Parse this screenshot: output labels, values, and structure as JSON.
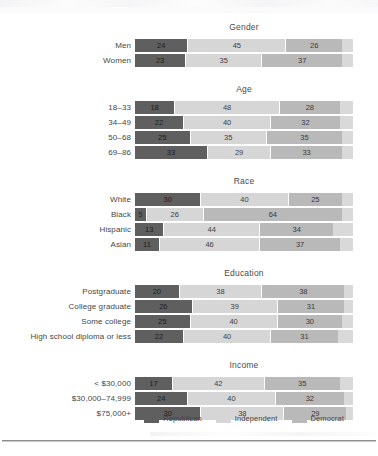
{
  "chart_data": {
    "type": "bar",
    "subtype": "stacked-horizontal-100",
    "title": "",
    "xlabel": "",
    "ylabel": "",
    "xlim": [
      0,
      100
    ],
    "grid": false,
    "legend_position": "bottom-center",
    "legend": [
      "Republican",
      "Independent",
      "Democrat"
    ],
    "series": [
      {
        "name": "Republican",
        "color": "#5f5f5f"
      },
      {
        "name": "Independent",
        "color": "#d6d6d6"
      },
      {
        "name": "Democrat",
        "color": "#b9b9b9"
      }
    ],
    "groups": [
      {
        "title": "Gender",
        "categories": [
          "Men",
          "Women"
        ],
        "rows": [
          {
            "label": "Men",
            "republican": 24,
            "independent": 45,
            "democrat": 26
          },
          {
            "label": "Women",
            "republican": 23,
            "independent": 35,
            "democrat": 37
          }
        ]
      },
      {
        "title": "Age",
        "categories": [
          "18–33",
          "34–49",
          "50–68",
          "69–86"
        ],
        "rows": [
          {
            "label": "18–33",
            "republican": 18,
            "independent": 48,
            "democrat": 28
          },
          {
            "label": "34–49",
            "republican": 22,
            "independent": 40,
            "democrat": 32
          },
          {
            "label": "50–68",
            "republican": 25,
            "independent": 35,
            "democrat": 35
          },
          {
            "label": "69–86",
            "republican": 33,
            "independent": 29,
            "democrat": 33
          }
        ]
      },
      {
        "title": "Race",
        "categories": [
          "White",
          "Black",
          "Hispanic",
          "Asian"
        ],
        "rows": [
          {
            "label": "White",
            "republican": 30,
            "independent": 40,
            "democrat": 25
          },
          {
            "label": "Black",
            "republican": 5,
            "independent": 26,
            "democrat": 64
          },
          {
            "label": "Hispanic",
            "republican": 13,
            "independent": 44,
            "democrat": 34
          },
          {
            "label": "Asian",
            "republican": 11,
            "independent": 46,
            "democrat": 37
          }
        ]
      },
      {
        "title": "Education",
        "categories": [
          "Postgraduate",
          "College graduate",
          "Some college",
          "High school diploma or less"
        ],
        "rows": [
          {
            "label": "Postgraduate",
            "republican": 20,
            "independent": 38,
            "democrat": 38
          },
          {
            "label": "College graduate",
            "republican": 26,
            "independent": 39,
            "democrat": 31
          },
          {
            "label": "Some college",
            "republican": 25,
            "independent": 40,
            "democrat": 30
          },
          {
            "label": "High school diploma or less",
            "republican": 22,
            "independent": 40,
            "democrat": 31
          }
        ]
      },
      {
        "title": "Income",
        "categories": [
          "< $30,000",
          "$30,000–74,999",
          "$75,000+"
        ],
        "rows": [
          {
            "label": "< $30,000",
            "republican": 17,
            "independent": 42,
            "democrat": 35
          },
          {
            "label": "$30,000–74,999",
            "republican": 24,
            "independent": 40,
            "democrat": 32
          },
          {
            "label": "$75,000+",
            "republican": 30,
            "independent": 38,
            "democrat": 29
          }
        ]
      }
    ]
  }
}
